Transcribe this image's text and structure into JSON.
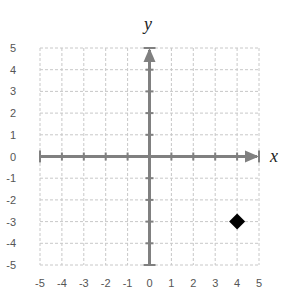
{
  "chart_data": {
    "type": "scatter",
    "title": "",
    "xlabel": "x",
    "ylabel": "y",
    "xlim": [
      -5,
      5
    ],
    "ylim": [
      -5,
      5
    ],
    "grid": true,
    "grid_style": "dashed",
    "x_ticks": [
      "-5",
      "-4",
      "-3",
      "-2",
      "-1",
      "0",
      "1",
      "2",
      "3",
      "4",
      "5"
    ],
    "y_ticks": [
      "5",
      "4",
      "3",
      "2",
      "1",
      "0",
      "-1",
      "-2",
      "-3",
      "-4",
      "-5"
    ],
    "series": [
      {
        "name": "point",
        "marker": "diamond",
        "color": "#000000",
        "points": [
          {
            "x": 4,
            "y": -3
          }
        ]
      }
    ],
    "axis_color": "#808080",
    "grid_color": "#c8c8c8"
  }
}
